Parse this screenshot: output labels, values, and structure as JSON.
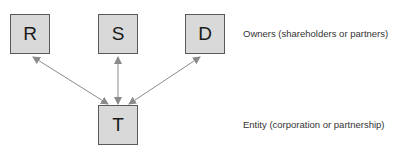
{
  "diagram": {
    "type": "ownership-structure",
    "nodes": [
      {
        "id": "R",
        "label": "R",
        "role": "owner"
      },
      {
        "id": "S",
        "label": "S",
        "role": "owner"
      },
      {
        "id": "D",
        "label": "D",
        "role": "owner"
      },
      {
        "id": "T",
        "label": "T",
        "role": "entity"
      }
    ],
    "edges": [
      {
        "from": "T",
        "to": "R",
        "direction": "bidirectional"
      },
      {
        "from": "T",
        "to": "S",
        "direction": "bidirectional"
      },
      {
        "from": "T",
        "to": "D",
        "direction": "bidirectional"
      }
    ],
    "labels": {
      "owners": "Owners (shareholders or partners)",
      "entity": "Entity (corporation or partnership)"
    },
    "colors": {
      "box_fill": "#d9d9d9",
      "box_border": "#5a5a5a",
      "arrow": "#8a8a8a",
      "text": "#333333"
    }
  }
}
